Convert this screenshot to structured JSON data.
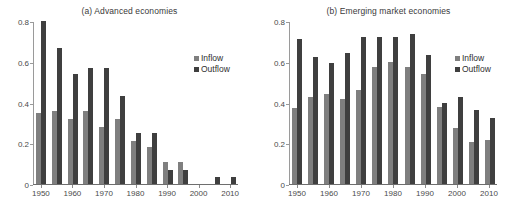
{
  "figure": {
    "panels": [
      {
        "id": "a",
        "title": "(a) Advanced economies"
      },
      {
        "id": "b",
        "title": "(b) Emerging market economies"
      }
    ],
    "legend": {
      "inflow_label": "Inflow",
      "outflow_label": "Outflow"
    },
    "colors": {
      "inflow": "#7f7f7f",
      "outflow": "#3f3f3f",
      "axis": "#6e6e6e",
      "text": "#4a4a4a"
    }
  },
  "chart_data": [
    {
      "type": "bar",
      "title": "(a) Advanced economies",
      "xlabel": "",
      "ylabel": "",
      "ylim": [
        0,
        0.8
      ],
      "yticks": [
        "0",
        "0.2",
        "0.4",
        "0.6",
        "0.8"
      ],
      "ytick_values": [
        0,
        0.2,
        0.4,
        0.6,
        0.8
      ],
      "grid": false,
      "legend_position": "top-right",
      "categories": [
        "1950",
        "1955",
        "1960",
        "1965",
        "1970",
        "1975",
        "1980",
        "1985",
        "1990",
        "1995",
        "2000",
        "2005",
        "2010"
      ],
      "xtick_labels": [
        "1950",
        "1960",
        "1970",
        "1980",
        "1990",
        "2000",
        "2010"
      ],
      "series": [
        {
          "name": "Inflow",
          "values": [
            0.35,
            0.36,
            0.32,
            0.36,
            0.28,
            0.32,
            0.21,
            0.18,
            0.11,
            0.11,
            0.0,
            0.0,
            0.0
          ]
        },
        {
          "name": "Outflow",
          "values": [
            0.8,
            0.67,
            0.54,
            0.57,
            0.57,
            0.43,
            0.25,
            0.25,
            0.07,
            0.07,
            0.0,
            0.035,
            0.035
          ]
        }
      ]
    },
    {
      "type": "bar",
      "title": "(b) Emerging market economies",
      "xlabel": "",
      "ylabel": "",
      "ylim": [
        0,
        0.8
      ],
      "yticks": [
        "0",
        "0.2",
        "0.4",
        "0.6",
        "0.8"
      ],
      "ytick_values": [
        0,
        0.2,
        0.4,
        0.6,
        0.8
      ],
      "grid": false,
      "legend_position": "top-right",
      "categories": [
        "1950",
        "1955",
        "1960",
        "1965",
        "1970",
        "1975",
        "1980",
        "1985",
        "1990",
        "1995",
        "2000",
        "2005",
        "2010"
      ],
      "xtick_labels": [
        "1950",
        "1960",
        "1970",
        "1980",
        "1990",
        "2000",
        "2010"
      ],
      "series": [
        {
          "name": "Inflow",
          "values": [
            0.375,
            0.425,
            0.44,
            0.415,
            0.46,
            0.575,
            0.6,
            0.575,
            0.54,
            0.38,
            0.275,
            0.205,
            0.215
          ]
        },
        {
          "name": "Outflow",
          "values": [
            0.71,
            0.625,
            0.595,
            0.645,
            0.72,
            0.72,
            0.72,
            0.735,
            0.635,
            0.4,
            0.425,
            0.365,
            0.325
          ]
        }
      ]
    }
  ]
}
